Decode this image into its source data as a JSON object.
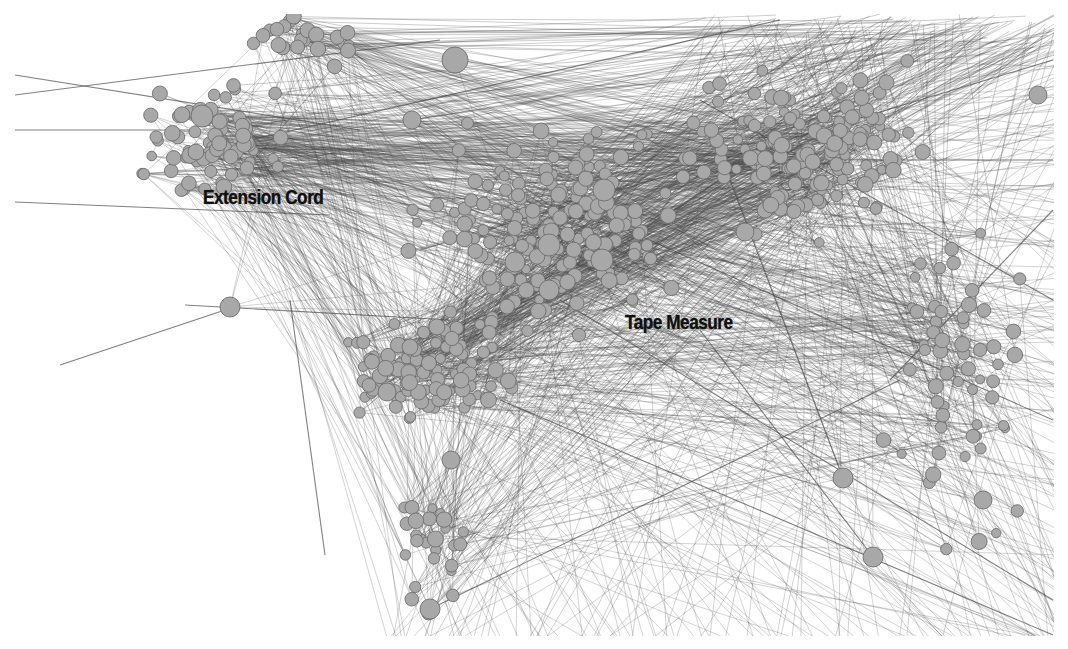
{
  "figure": {
    "type": "network-graph",
    "background_color": "#ffffff",
    "node_fill": "#a8a8a8",
    "node_stroke": "#6e6e6e",
    "edge_color": "#4a4a4a",
    "labels": [
      {
        "id": "extension-cord",
        "text": "Extension Cord",
        "x": 203,
        "y": 185
      },
      {
        "id": "tape-measure",
        "text": "Tape Measure",
        "x": 625,
        "y": 310
      }
    ],
    "top_heading_cropped": "",
    "bottom_caption_cropped": "",
    "clusters": [
      {
        "name": "extension-cord-cluster",
        "cx": 215,
        "cy": 140,
        "rx": 95,
        "ry": 75,
        "count": 70
      },
      {
        "name": "central-dense-cluster",
        "cx": 560,
        "cy": 230,
        "rx": 170,
        "ry": 130,
        "count": 170
      },
      {
        "name": "upper-right-cluster",
        "cx": 790,
        "cy": 150,
        "rx": 170,
        "ry": 110,
        "count": 140
      },
      {
        "name": "lower-left-cluster",
        "cx": 420,
        "cy": 370,
        "rx": 120,
        "ry": 70,
        "count": 110
      },
      {
        "name": "bottom-stem",
        "cx": 430,
        "cy": 540,
        "rx": 45,
        "ry": 90,
        "count": 28
      },
      {
        "name": "right-sparse",
        "cx": 960,
        "cy": 380,
        "rx": 90,
        "ry": 200,
        "count": 60
      },
      {
        "name": "top-left-cluster",
        "cx": 300,
        "cy": 40,
        "rx": 80,
        "ry": 30,
        "count": 25
      }
    ],
    "hub_nodes": [
      {
        "x": 202,
        "y": 116,
        "r": 11
      },
      {
        "x": 455,
        "y": 60,
        "r": 13
      },
      {
        "x": 604,
        "y": 190,
        "r": 11
      },
      {
        "x": 549,
        "y": 245,
        "r": 11
      },
      {
        "x": 602,
        "y": 260,
        "r": 11
      },
      {
        "x": 549,
        "y": 290,
        "r": 10
      },
      {
        "x": 515,
        "y": 262,
        "r": 10
      },
      {
        "x": 412,
        "y": 120,
        "r": 9
      },
      {
        "x": 230,
        "y": 307,
        "r": 10
      },
      {
        "x": 873,
        "y": 557,
        "r": 10
      },
      {
        "x": 843,
        "y": 478,
        "r": 10
      },
      {
        "x": 983,
        "y": 500,
        "r": 9
      },
      {
        "x": 430,
        "y": 609,
        "r": 10
      },
      {
        "x": 451,
        "y": 460,
        "r": 9
      },
      {
        "x": 387,
        "y": 392,
        "r": 9
      },
      {
        "x": 745,
        "y": 232,
        "r": 9
      },
      {
        "x": 1038,
        "y": 95,
        "r": 9
      }
    ],
    "long_edges": [
      [
        15,
        95,
        440,
        40
      ],
      [
        15,
        75,
        360,
        130
      ],
      [
        15,
        130,
        200,
        130
      ],
      [
        15,
        202,
        330,
        215
      ],
      [
        60,
        365,
        240,
        305
      ],
      [
        325,
        555,
        290,
        300
      ],
      [
        185,
        305,
        450,
        320
      ],
      [
        890,
        380,
        1053,
        210
      ],
      [
        700,
        330,
        873,
        557
      ],
      [
        560,
        200,
        1053,
        420
      ],
      [
        430,
        609,
        900,
        380
      ],
      [
        560,
        300,
        1053,
        600
      ],
      [
        730,
        180,
        843,
        478
      ],
      [
        500,
        400,
        1053,
        635
      ],
      [
        420,
        250,
        1053,
        60
      ],
      [
        700,
        100,
        1053,
        300
      ],
      [
        320,
        160,
        1053,
        160
      ],
      [
        250,
        140,
        780,
        20
      ]
    ]
  }
}
